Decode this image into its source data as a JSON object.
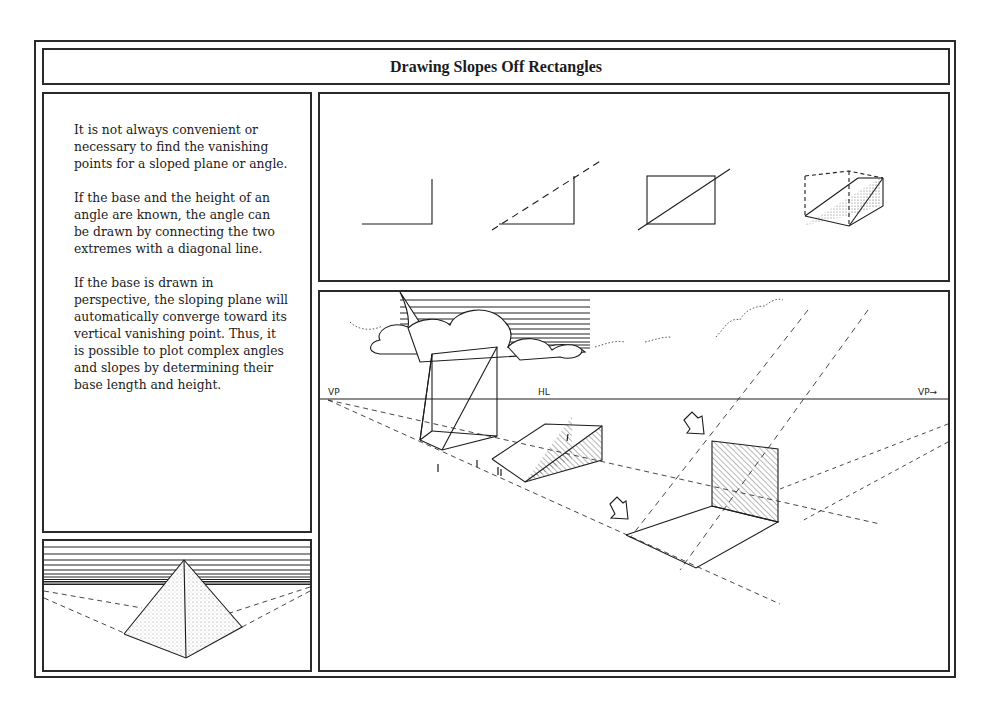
{
  "page": {
    "title": "Drawing Slopes Off Rectangles"
  },
  "text_panel": {
    "paragraphs": [
      "It is not always convenient or necessary to find the vanishing points for a sloped plane or angle.",
      "If the base and the height of an angle are known, the angle can be drawn by connecting the two extremes with a diagonal line.",
      "If the base is drawn in perspective, the sloping plane will automatically converge toward its vertical vanishing point. Thus, it is possible to plot complex angles and slopes by determining their base length and height."
    ]
  },
  "steps_panel": {
    "steps": [
      {
        "name": "base-and-height"
      },
      {
        "name": "diagonal-connection"
      },
      {
        "name": "rectangle-with-diagonal"
      },
      {
        "name": "3d-wedge-box"
      }
    ]
  },
  "scene_panel": {
    "vp_left_label": "VP",
    "hl_label": "HL",
    "vp_right_label": "VP→"
  },
  "pyramid_panel": {
    "name": "pyramid-perspective"
  },
  "colors": {
    "ink": "#1c1c1c",
    "paper": "#ffffff"
  }
}
